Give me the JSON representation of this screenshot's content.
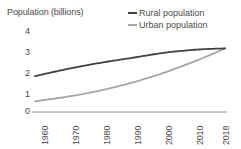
{
  "chart_data": {
    "type": "line",
    "title": "Population (billions)",
    "xlabel": "",
    "ylabel": "Population (billions)",
    "ylim": [
      0,
      4
    ],
    "yticks": [
      "0",
      "1",
      "2",
      "3",
      "4"
    ],
    "grid": false,
    "legend_position": "top-right",
    "categories": [
      "1960",
      "1970",
      "1980",
      "1990",
      "2000",
      "2010",
      "2018"
    ],
    "x": [
      1960,
      1970,
      1980,
      1990,
      2000,
      2010,
      2018
    ],
    "series": [
      {
        "name": "Rural population",
        "color": "#404040",
        "values": [
          1.75,
          2.1,
          2.4,
          2.65,
          2.9,
          3.05,
          3.1
        ]
      },
      {
        "name": "Urban population",
        "color": "#a6a6a6",
        "values": [
          0.52,
          0.75,
          1.05,
          1.45,
          1.95,
          2.55,
          3.1
        ]
      }
    ]
  },
  "axis": {
    "title": "Population (billions)",
    "y_tick_labels": [
      "4",
      "3",
      "2",
      "1",
      "0"
    ],
    "x_tick_labels": [
      "1960",
      "1970",
      "1980",
      "1990",
      "2000",
      "2010",
      "2018"
    ]
  },
  "legend": {
    "items": [
      {
        "label": "Rural population",
        "color": "#404040"
      },
      {
        "label": "Urban population",
        "color": "#a6a6a6"
      }
    ]
  },
  "colors": {
    "rural": "#404040",
    "urban": "#a6a6a6",
    "axis": "#8c8c8c",
    "text": "#4a4a4a",
    "background": "#ffffff"
  }
}
